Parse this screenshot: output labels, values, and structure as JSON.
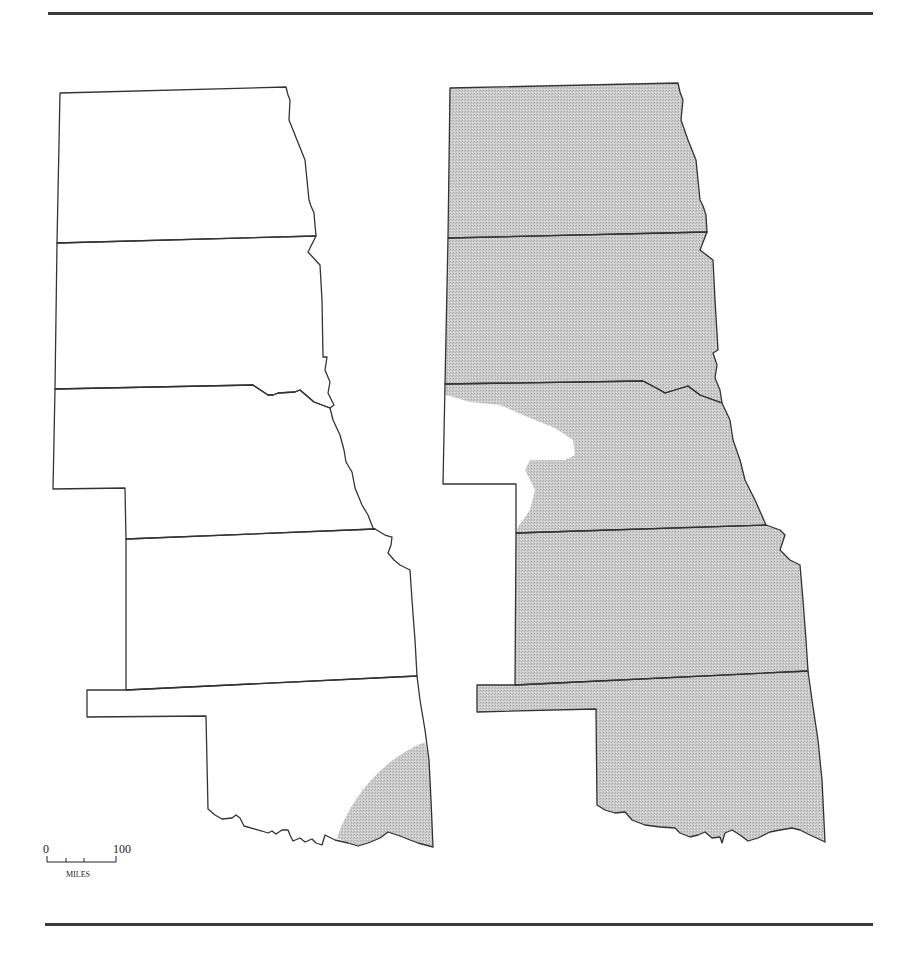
{
  "figure": {
    "colors": {
      "outline": "#333333",
      "shade": "#c9c9c9",
      "background": "#ffffff",
      "rule": "#3a3a3a"
    }
  },
  "maps": [
    {
      "id": "left",
      "states": [
        "North Dakota",
        "South Dakota",
        "Nebraska",
        "Kansas",
        "Oklahoma"
      ],
      "shaded_region": "southeastern corner of Oklahoma"
    },
    {
      "id": "right",
      "states": [
        "North Dakota",
        "South Dakota",
        "Nebraska",
        "Kansas",
        "Oklahoma"
      ],
      "shaded_region": "all states except western Nebraska panhandle area"
    }
  ],
  "scale_bar": {
    "start_label": "0",
    "end_label": "100",
    "unit_label": "MILES"
  }
}
